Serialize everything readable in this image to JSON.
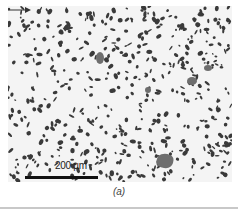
{
  "figure": {
    "scale_bar_label": "200 µm",
    "caption_open": "(",
    "caption_letter": "a",
    "caption_close": ")",
    "colors": {
      "matrix": "#f4f4f4",
      "particles": "#3a3a3a",
      "gray_phase": "#6e6e6e",
      "scale_bar": "#111111",
      "rule": "#c8c8c8"
    }
  }
}
